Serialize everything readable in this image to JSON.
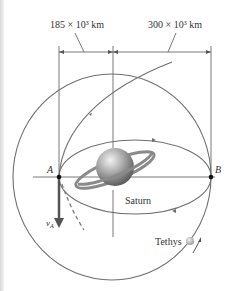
{
  "figure": {
    "dimension_left": "185 × 10³ km",
    "dimension_right": "300 × 10³ km",
    "point_a": "A",
    "point_b": "B",
    "planet_label": "Saturn",
    "moon_label": "Tethys",
    "velocity_label": "v",
    "velocity_subscript": "A"
  },
  "colors": {
    "orbit": "#6f6f6f",
    "line": "#555555",
    "planet": "#9a9a9a",
    "arrow": "#555555"
  }
}
